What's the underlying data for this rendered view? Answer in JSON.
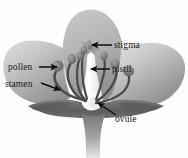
{
  "figure": {
    "background_color": "#fdfdfd",
    "style": "grayscale shaded botanical illustration"
  },
  "labels": [
    {
      "id": "stigma",
      "text": "stigma",
      "text_x": 114,
      "text_y": 48,
      "arrow_from_x": 112,
      "arrow_from_y": 45,
      "arrow_to_x": 92,
      "arrow_to_y": 45,
      "side": "right",
      "points_to": "stigma"
    },
    {
      "id": "pistil",
      "text": "pistil",
      "text_x": 112,
      "text_y": 72,
      "arrow_from_x": 110,
      "arrow_from_y": 69,
      "arrow_to_x": 91,
      "arrow_to_y": 69,
      "side": "right",
      "points_to": "style"
    },
    {
      "id": "pollen",
      "text": "pollen",
      "text_x": 8,
      "text_y": 70,
      "arrow_from_x": 39,
      "arrow_from_y": 67,
      "arrow_to_x": 57,
      "arrow_to_y": 67,
      "side": "left",
      "points_to": "anther"
    },
    {
      "id": "stamen",
      "text": "stamen",
      "text_x": 5,
      "text_y": 87,
      "arrow_from_x": 41,
      "arrow_from_y": 83,
      "arrow_to_x": 60,
      "arrow_to_y": 90,
      "side": "left",
      "points_to": "filament"
    },
    {
      "id": "ovule",
      "text": "ovule",
      "text_x": 115,
      "text_y": 122,
      "arrow_from_x": 116,
      "arrow_from_y": 115,
      "arrow_to_x": 98,
      "arrow_to_y": 103,
      "side": "right",
      "points_to": "ovary"
    }
  ],
  "parts": [
    {
      "id": "center-petal",
      "name": "center-petal",
      "color_light": "#cfcfcf",
      "color_dark": "#949494"
    },
    {
      "id": "left-petal",
      "name": "left-petal",
      "color_light": "#d4d4d4",
      "color_dark": "#9a9a9a"
    },
    {
      "id": "right-petal",
      "name": "right-petal",
      "color_light": "#d9d9d9",
      "color_dark": "#8d8d8d"
    },
    {
      "id": "sepal-band",
      "name": "sepal-band",
      "color_light": "#6e6e6e",
      "color_dark": "#545454"
    },
    {
      "id": "stem",
      "name": "stem",
      "color_light": "#8a8a8a",
      "color_dark": "#c9c9c9"
    },
    {
      "id": "pistil-column",
      "name": "pistil-column",
      "color_light": "#ffffff",
      "color_dark": "#e2e2e2"
    },
    {
      "id": "stigma-head",
      "name": "stigma-head",
      "color_light": "#a8a8a8",
      "color_dark": "#7e7e7e"
    },
    {
      "id": "stamen-filament",
      "name": "stamen-filament",
      "color_light": "#5d5d5d",
      "color_dark": "#3f3f3f"
    },
    {
      "id": "anther",
      "name": "anther",
      "color_light": "#8f8f8f",
      "color_dark": "#6a6a6a"
    }
  ],
  "colors": {
    "label_text": "#1a1a1a",
    "arrow": "#0d0d0d",
    "background": "#fdfdfd"
  }
}
